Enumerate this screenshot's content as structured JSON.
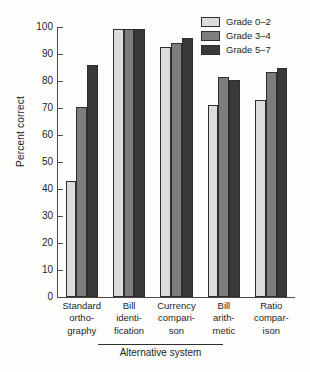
{
  "chart_data": {
    "type": "bar",
    "title": "",
    "xlabel": "Alternative system",
    "ylabel": "Percent correct",
    "ylim": [
      0,
      100
    ],
    "yticks": [
      0,
      10,
      20,
      30,
      40,
      50,
      60,
      70,
      80,
      90,
      100
    ],
    "grid": false,
    "legend_position": "top-right",
    "categories": [
      "Standard ortho-graphy",
      "Bill identi-fication",
      "Currency compari-son",
      "Bill arith-metic",
      "Ratio compar-ison"
    ],
    "category_lines": [
      [
        "Standard",
        "ortho-",
        "graphy"
      ],
      [
        "Bill",
        "identi-",
        "fication"
      ],
      [
        "Currency",
        "compari-",
        "son"
      ],
      [
        "Bill",
        "arith-",
        "metic"
      ],
      [
        "Ratio",
        "compar-",
        "ison"
      ]
    ],
    "series": [
      {
        "name": "Grade 0–2",
        "color": "#dcdcdc",
        "values": [
          43,
          99.3,
          92.5,
          71,
          73
        ]
      },
      {
        "name": "Grade 3–4",
        "color": "#7d7d7d",
        "values": [
          70.5,
          99.3,
          94,
          81.5,
          83.5
        ]
      },
      {
        "name": "Grade 5–7",
        "color": "#393939",
        "values": [
          86,
          99.3,
          96,
          80.5,
          85
        ]
      }
    ]
  },
  "axes": {
    "ylabel": "Percent correct",
    "xgroup_label": "Alternative system"
  },
  "legend": {
    "items": [
      {
        "label": "Grade 0–2",
        "swatch": "#dcdcdc"
      },
      {
        "label": "Grade 3–4",
        "swatch": "#7d7d7d"
      },
      {
        "label": "Grade 5–7",
        "swatch": "#393939"
      }
    ]
  }
}
